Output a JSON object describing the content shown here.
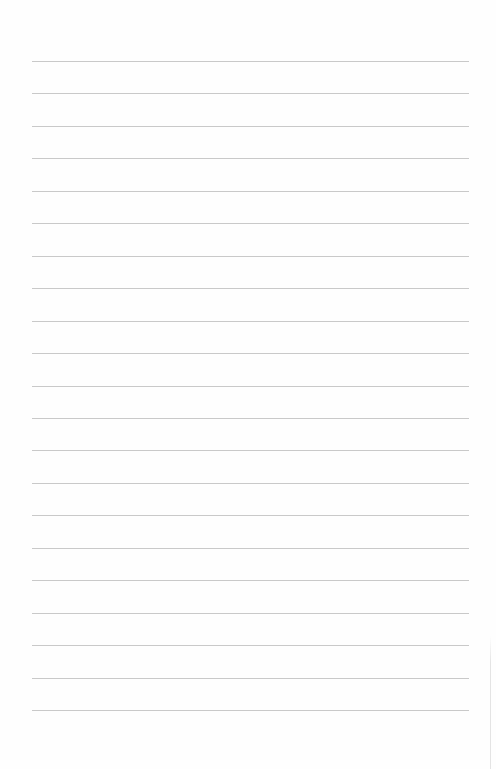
{
  "page": {
    "type": "lined-paper",
    "background_color": "#fefefe",
    "rule_color": "#c9c9c9",
    "rule_count": 21,
    "rule_left_px": 32,
    "rule_right_px": 469,
    "first_rule_y_px": 61,
    "rule_spacing_px": 32.45,
    "content_text": ""
  }
}
